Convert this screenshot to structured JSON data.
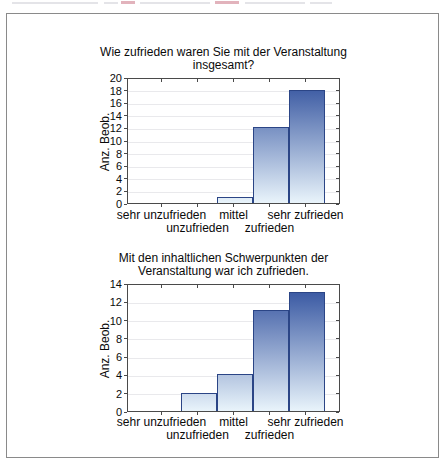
{
  "panel": {
    "border_color": "#8a8a8a",
    "background": "#ffffff"
  },
  "colors": {
    "bar_gradient_top": "#2f4f9d",
    "bar_gradient_bottom": "#e9f4fb",
    "bar_border": "#2b4586",
    "gridline": "#e9e9ec",
    "axis": "#4a4a4a",
    "text": "#0a0a0a"
  },
  "chart_data": [
    {
      "type": "bar",
      "title": "Wie zufrieden waren Sie mit der Veranstaltung insgesamt?",
      "title_lines": [
        "Wie zufrieden waren Sie mit der Veranstaltung",
        "insgesamt?"
      ],
      "ylabel": "Anz. Beob.",
      "xlabel": "",
      "categories": [
        "sehr unzufrieden",
        "unzufrieden",
        "mittel",
        "zufrieden",
        "sehr zufrieden"
      ],
      "values": [
        0,
        0,
        1,
        12,
        18
      ],
      "ylim": [
        0,
        20
      ],
      "ytick_step": 2,
      "ytick_labels": [
        "0",
        "2",
        "4",
        "6",
        "8",
        "10",
        "12",
        "14",
        "16",
        "18",
        "20"
      ],
      "grid": true,
      "legend": "none"
    },
    {
      "type": "bar",
      "title": "Mit den inhaltlichen Schwerpunkten der Veranstaltung war ich zufrieden.",
      "title_lines": [
        "Mit den inhaltlichen Schwerpunkten der",
        "Veranstaltung war ich zufrieden."
      ],
      "ylabel": "Anz. Beob.",
      "xlabel": "",
      "categories": [
        "sehr unzufrieden",
        "unzufrieden",
        "mittel",
        "zufrieden",
        "sehr zufrieden"
      ],
      "values": [
        0,
        2,
        4,
        11,
        13
      ],
      "ylim": [
        0,
        14
      ],
      "ytick_step": 2,
      "ytick_labels": [
        "0",
        "2",
        "4",
        "6",
        "8",
        "10",
        "12",
        "14"
      ],
      "grid": true,
      "legend": "none"
    }
  ]
}
